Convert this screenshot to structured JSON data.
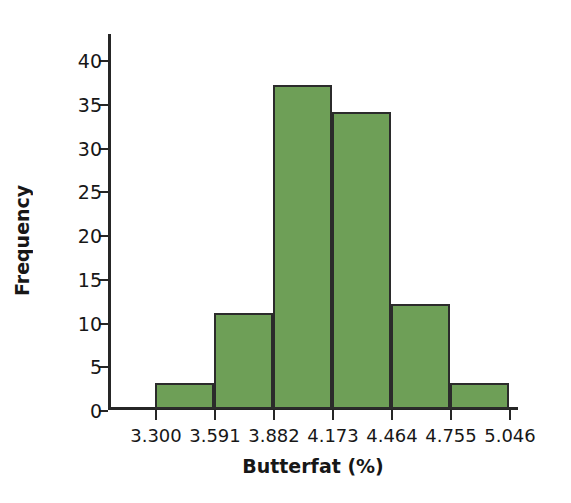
{
  "chart_data": {
    "type": "bar",
    "title": "",
    "xlabel": "Butterfat (%)",
    "ylabel": "Frequency",
    "categories": [
      "3.300-3.591",
      "3.591-3.882",
      "3.882-4.173",
      "4.173-4.464",
      "4.464-4.755",
      "4.755-5.046"
    ],
    "values": [
      3,
      11,
      37,
      34,
      12,
      3
    ],
    "bin_edges": [
      3.3,
      3.591,
      3.882,
      4.173,
      4.464,
      4.755,
      5.046
    ],
    "x_tick_labels": [
      "3.300",
      "3.591",
      "3.882",
      "4.173",
      "4.464",
      "4.755",
      "5.046"
    ],
    "y_tick_labels": [
      "0",
      "5",
      "10",
      "15",
      "20",
      "25",
      "30",
      "35",
      "40"
    ],
    "y_ticks": [
      0,
      5,
      10,
      15,
      20,
      25,
      30,
      35,
      40
    ],
    "ylim": [
      0,
      43
    ],
    "xlim": [
      3.3,
      5.046
    ],
    "grid": false,
    "legend": null,
    "bar_color": "#6e9f57",
    "bar_edge_color": "#2b2b2b",
    "axis_color": "#262626"
  },
  "figure": {
    "background": "#ffffff",
    "caption_fragment": ""
  }
}
